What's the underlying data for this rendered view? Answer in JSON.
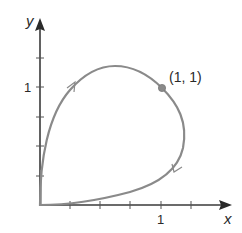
{
  "diagram": {
    "type": "parametric-curve",
    "axes": {
      "x_label": "x",
      "y_label": "y",
      "x_tick_label": "1",
      "y_tick_label": "1",
      "x_ticks": [
        0.2,
        0.4,
        0.6,
        0.8,
        1.0,
        1.2
      ],
      "y_ticks": [
        0.2,
        0.4,
        0.6,
        0.8,
        1.0,
        1.2
      ]
    },
    "point": {
      "label": "(1, 1)",
      "x": 1,
      "y": 1
    },
    "curve": {
      "description": "closed loop starting and ending at origin, traversed clockwise",
      "direction_arrows": 2
    },
    "colors": {
      "curve": "#8a8a8a",
      "axes": "#3a3a3a",
      "point": "#8a8a8a"
    }
  }
}
